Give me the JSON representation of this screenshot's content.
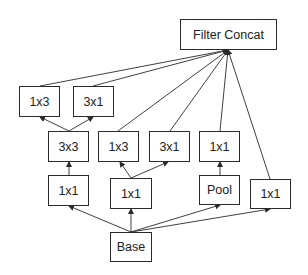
{
  "diagram": {
    "type": "inception-module",
    "colors": {
      "stroke": "#2a2a2a",
      "text": "#222222",
      "background": "#ffffff"
    },
    "nodes": [
      {
        "id": "concat",
        "label": "Filter Concat",
        "x": 180,
        "y": 19,
        "w": 97,
        "h": 31
      },
      {
        "id": "b1_1x3",
        "label": "1x3",
        "x": 19,
        "y": 86,
        "w": 41,
        "h": 31
      },
      {
        "id": "b1_3x1",
        "label": "3x1",
        "x": 73,
        "y": 86,
        "w": 41,
        "h": 31
      },
      {
        "id": "b1_3x3",
        "label": "3x3",
        "x": 48,
        "y": 131,
        "w": 41,
        "h": 31
      },
      {
        "id": "b1_1x1",
        "label": "1x1",
        "x": 48,
        "y": 175,
        "w": 41,
        "h": 31
      },
      {
        "id": "b2_1x3",
        "label": "1x3",
        "x": 98,
        "y": 131,
        "w": 41,
        "h": 31
      },
      {
        "id": "b2_3x1",
        "label": "3x1",
        "x": 149,
        "y": 131,
        "w": 41,
        "h": 31
      },
      {
        "id": "b2_1x1",
        "label": "1x1",
        "x": 110,
        "y": 178,
        "w": 42,
        "h": 31
      },
      {
        "id": "b3_1x1",
        "label": "1x1",
        "x": 199,
        "y": 131,
        "w": 41,
        "h": 31
      },
      {
        "id": "b3_pool",
        "label": "Pool",
        "x": 199,
        "y": 175,
        "w": 41,
        "h": 30
      },
      {
        "id": "b4_1x1",
        "label": "1x1",
        "x": 250,
        "y": 179,
        "w": 41,
        "h": 30
      },
      {
        "id": "base",
        "label": "Base",
        "x": 110,
        "y": 232,
        "w": 42,
        "h": 30
      }
    ],
    "edges": [
      {
        "from": [
          131,
          232
        ],
        "to": [
          69,
          206
        ]
      },
      {
        "from": [
          131,
          232
        ],
        "to": [
          131,
          209
        ]
      },
      {
        "from": [
          131,
          232
        ],
        "to": [
          220,
          205
        ]
      },
      {
        "from": [
          131,
          232
        ],
        "to": [
          270,
          209
        ]
      },
      {
        "from": [
          69,
          175
        ],
        "to": [
          69,
          162
        ]
      },
      {
        "from": [
          69,
          131
        ],
        "to": [
          40,
          117
        ]
      },
      {
        "from": [
          69,
          131
        ],
        "to": [
          93,
          117
        ]
      },
      {
        "from": [
          131,
          178
        ],
        "to": [
          120,
          162
        ]
      },
      {
        "from": [
          131,
          178
        ],
        "to": [
          168,
          162
        ]
      },
      {
        "from": [
          220,
          175
        ],
        "to": [
          220,
          162
        ]
      },
      {
        "from": [
          40,
          86
        ],
        "to": [
          228,
          50
        ]
      },
      {
        "from": [
          93,
          86
        ],
        "to": [
          228,
          50
        ]
      },
      {
        "from": [
          118,
          131
        ],
        "to": [
          228,
          50
        ]
      },
      {
        "from": [
          170,
          131
        ],
        "to": [
          228,
          50
        ]
      },
      {
        "from": [
          220,
          131
        ],
        "to": [
          228,
          50
        ]
      },
      {
        "from": [
          270,
          179
        ],
        "to": [
          228,
          50
        ]
      }
    ]
  }
}
